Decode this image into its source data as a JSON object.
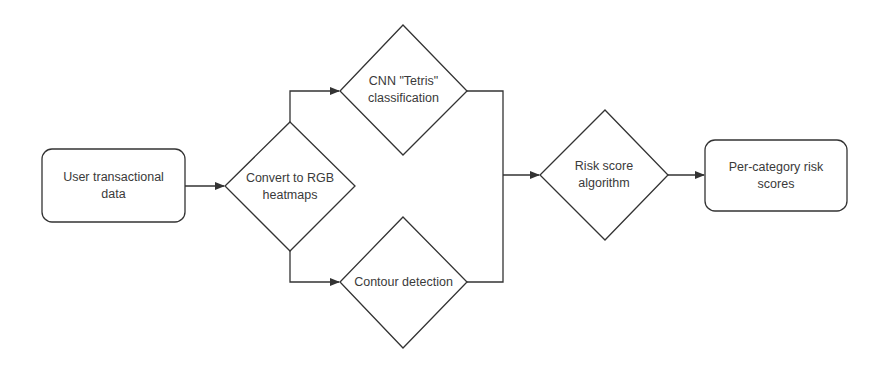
{
  "diagram": {
    "type": "flowchart",
    "colors": {
      "stroke": "#333333",
      "text": "#3a3a3a",
      "background": "#ffffff"
    },
    "nodes": [
      {
        "id": "input",
        "shape": "rounded-rectangle",
        "label": "User transactional\ndata"
      },
      {
        "id": "convert",
        "shape": "diamond",
        "label": "Convert to RGB\nheatmaps"
      },
      {
        "id": "cnn",
        "shape": "diamond",
        "label": "CNN \"Tetris\"\nclassification"
      },
      {
        "id": "contour",
        "shape": "diamond",
        "label": "Contour detection"
      },
      {
        "id": "risk",
        "shape": "diamond",
        "label": "Risk score\nalgorithm"
      },
      {
        "id": "output",
        "shape": "rounded-rectangle",
        "label": "Per-category risk\nscores"
      }
    ],
    "edges": [
      {
        "from": "input",
        "to": "convert"
      },
      {
        "from": "convert",
        "to": "cnn"
      },
      {
        "from": "convert",
        "to": "contour"
      },
      {
        "from": "cnn",
        "to": "risk"
      },
      {
        "from": "contour",
        "to": "risk"
      },
      {
        "from": "risk",
        "to": "output"
      }
    ]
  }
}
